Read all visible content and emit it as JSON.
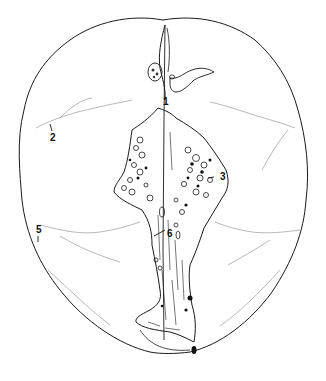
{
  "figure": {
    "line_color": "#1a1a1a",
    "faint_line_color": "#9a9a9a",
    "labels": [
      {
        "id": "1",
        "text": "1",
        "x": 163,
        "y": 97
      },
      {
        "id": "2",
        "text": "2",
        "x": 50,
        "y": 133
      },
      {
        "id": "3",
        "text": "3",
        "x": 220,
        "y": 172
      },
      {
        "id": "5",
        "text": "5",
        "x": 36,
        "y": 225
      },
      {
        "id": "6",
        "text": "6",
        "x": 167,
        "y": 229
      }
    ]
  }
}
